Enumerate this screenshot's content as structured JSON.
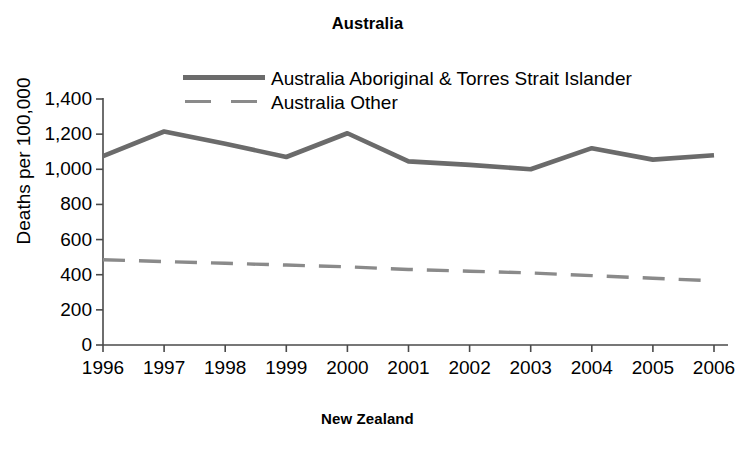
{
  "figure": {
    "title": "Australia",
    "bottom_caption": "New Zealand"
  },
  "axes": {
    "ylabel": "Deaths per 100,000",
    "ytick_labels": [
      "1,400",
      "1,200",
      "1,000",
      "800",
      "600",
      "400",
      "200",
      "0"
    ],
    "xtick_labels": [
      "1996",
      "1997",
      "1998",
      "1999",
      "2000",
      "2001",
      "2002",
      "2003",
      "2004",
      "2005",
      "2006"
    ]
  },
  "legend": {
    "items": [
      {
        "label": "Australia Aboriginal & Torres Strait Islander",
        "style": "solid",
        "color": "#6b6b6b"
      },
      {
        "label": "Australia Other",
        "style": "dashed",
        "color": "#8a8a8a"
      }
    ]
  },
  "colors": {
    "axis": "#4a4a4a",
    "series_solid": "#6b6b6b",
    "series_dashed": "#8a8a8a",
    "text": "#000000",
    "background": "#ffffff"
  },
  "chart_data": {
    "type": "line",
    "title": "Australia",
    "xlabel": "",
    "ylabel": "Deaths per 100,000",
    "categories": [
      1996,
      1997,
      1998,
      1999,
      2000,
      2001,
      2002,
      2003,
      2004,
      2005,
      2006
    ],
    "x": [
      1996,
      1997,
      1998,
      1999,
      2000,
      2001,
      2002,
      2003,
      2004,
      2005,
      2006
    ],
    "xlim": [
      1996,
      2006
    ],
    "ylim": [
      0,
      1400
    ],
    "ytick_values": [
      0,
      200,
      400,
      600,
      800,
      1000,
      1200,
      1400
    ],
    "grid": false,
    "legend_position": "top-center",
    "series": [
      {
        "name": "Australia Aboriginal & Torres Strait Islander",
        "style": "solid",
        "color": "#6b6b6b",
        "values": [
          1075,
          1215,
          1145,
          1070,
          1205,
          1045,
          1025,
          1000,
          1120,
          1055,
          1080
        ]
      },
      {
        "name": "Australia Other",
        "style": "dashed",
        "color": "#8a8a8a",
        "values": [
          485,
          475,
          465,
          455,
          445,
          430,
          420,
          410,
          395,
          380,
          365
        ]
      }
    ]
  }
}
